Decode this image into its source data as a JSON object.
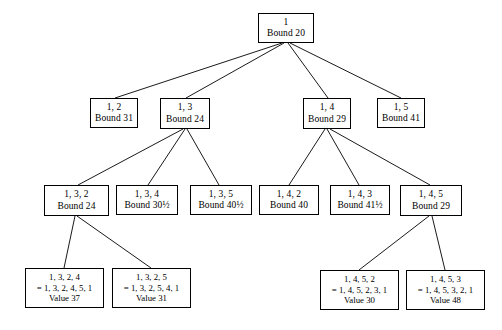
{
  "figure": {
    "name": "branch-and-bound-search-tree",
    "background_color": "#ffffff",
    "line_color": "#000000",
    "text_color": "#000000"
  },
  "nodes": [
    {
      "id": "root",
      "label_lines": [
        "1",
        "Bound 20"
      ],
      "path": "1",
      "bound": "20",
      "x": 258,
      "y": 13,
      "w": 56,
      "h": 30,
      "kind": "internal"
    },
    {
      "id": "n12",
      "label_lines": [
        "1, 2",
        "Bound 31"
      ],
      "path": "1, 2",
      "bound": "31",
      "x": 90,
      "y": 98,
      "w": 48,
      "h": 30,
      "kind": "internal"
    },
    {
      "id": "n13",
      "label_lines": [
        "1, 3",
        "Bound 24"
      ],
      "path": "1, 3",
      "bound": "24",
      "x": 160,
      "y": 98,
      "w": 50,
      "h": 31,
      "kind": "internal"
    },
    {
      "id": "n14",
      "label_lines": [
        "1, 4",
        "Bound 29"
      ],
      "path": "1, 4",
      "bound": "29",
      "x": 303,
      "y": 98,
      "w": 48,
      "h": 31,
      "kind": "internal"
    },
    {
      "id": "n15",
      "label_lines": [
        "1, 5",
        "Bound 41"
      ],
      "path": "1, 5",
      "bound": "41",
      "x": 377,
      "y": 98,
      "w": 48,
      "h": 30,
      "kind": "internal"
    },
    {
      "id": "n132",
      "label_lines": [
        "1, 3, 2",
        "Bound 24"
      ],
      "path": "1, 3, 2",
      "bound": "24",
      "x": 44,
      "y": 185,
      "w": 65,
      "h": 31,
      "kind": "internal"
    },
    {
      "id": "n134",
      "label_lines": [
        "1, 3, 4",
        "Bound 30½"
      ],
      "path": "1, 3, 4",
      "bound": "30½",
      "x": 116,
      "y": 185,
      "w": 62,
      "h": 30,
      "kind": "internal"
    },
    {
      "id": "n135",
      "label_lines": [
        "1, 3, 5",
        "Bound 40½"
      ],
      "path": "1, 3, 5",
      "bound": "40½",
      "x": 190,
      "y": 185,
      "w": 62,
      "h": 30,
      "kind": "internal"
    },
    {
      "id": "n142",
      "label_lines": [
        "1, 4, 2",
        "Bound 40"
      ],
      "path": "1, 4, 2",
      "bound": "40",
      "x": 259,
      "y": 185,
      "w": 60,
      "h": 30,
      "kind": "internal"
    },
    {
      "id": "n143",
      "label_lines": [
        "1, 4, 3",
        "Bound 41½"
      ],
      "path": "1, 4, 3",
      "bound": "41½",
      "x": 330,
      "y": 185,
      "w": 60,
      "h": 30,
      "kind": "internal"
    },
    {
      "id": "n145",
      "label_lines": [
        "1, 4, 5",
        "Bound 29"
      ],
      "path": "1, 4, 5",
      "bound": "29",
      "x": 400,
      "y": 185,
      "w": 62,
      "h": 31,
      "kind": "internal"
    },
    {
      "id": "n1324",
      "label_lines": [
        "1, 3, 2, 4",
        "= 1, 3, 2, 4, 5, 1",
        "Value 37"
      ],
      "path": "1, 3, 2, 4",
      "tour": "= 1, 3, 2, 4, 5, 1",
      "value": "Value 37",
      "x": 25,
      "y": 268,
      "w": 79,
      "h": 40,
      "kind": "leaf"
    },
    {
      "id": "n1325",
      "label_lines": [
        "1, 3, 2, 5",
        "= 1, 3, 2, 5, 4, 1",
        "Value 31"
      ],
      "path": "1, 3, 2, 5",
      "tour": "= 1, 3, 2, 5, 4, 1",
      "value": "Value 31",
      "x": 112,
      "y": 268,
      "w": 79,
      "h": 40,
      "kind": "leaf"
    },
    {
      "id": "n1452",
      "label_lines": [
        "1, 4, 5, 2",
        "= 1, 4, 5, 2, 3, 1",
        "Value 30"
      ],
      "path": "1, 4, 5, 2",
      "tour": "= 1, 4, 5, 2, 3, 1",
      "value": "Value 30",
      "x": 320,
      "y": 270,
      "w": 79,
      "h": 40,
      "kind": "leaf"
    },
    {
      "id": "n1453",
      "label_lines": [
        "1, 4, 5, 3",
        "= 1, 4, 5, 3, 2, 1",
        "Value 48"
      ],
      "path": "1, 4, 5, 3",
      "tour": "= 1, 4, 5, 3, 2, 1",
      "value": "Value 48",
      "x": 406,
      "y": 270,
      "w": 79,
      "h": 40,
      "kind": "leaf"
    }
  ],
  "edges": [
    {
      "from": "root",
      "to": "n12",
      "x1": 282,
      "y1": 43,
      "x2": 115,
      "y2": 98
    },
    {
      "from": "root",
      "to": "n13",
      "x1": 284,
      "y1": 43,
      "x2": 186,
      "y2": 98
    },
    {
      "from": "root",
      "to": "n14",
      "x1": 288,
      "y1": 43,
      "x2": 328,
      "y2": 98
    },
    {
      "from": "root",
      "to": "n15",
      "x1": 290,
      "y1": 43,
      "x2": 401,
      "y2": 98
    },
    {
      "from": "n13",
      "to": "n132",
      "x1": 183,
      "y1": 129,
      "x2": 78,
      "y2": 185
    },
    {
      "from": "n13",
      "to": "n134",
      "x1": 185,
      "y1": 129,
      "x2": 148,
      "y2": 185
    },
    {
      "from": "n13",
      "to": "n135",
      "x1": 187,
      "y1": 129,
      "x2": 219,
      "y2": 185
    },
    {
      "from": "n14",
      "to": "n142",
      "x1": 325,
      "y1": 129,
      "x2": 289,
      "y2": 185
    },
    {
      "from": "n14",
      "to": "n143",
      "x1": 327,
      "y1": 129,
      "x2": 359,
      "y2": 185
    },
    {
      "from": "n14",
      "to": "n145",
      "x1": 330,
      "y1": 129,
      "x2": 430,
      "y2": 185
    },
    {
      "from": "n132",
      "to": "n1324",
      "x1": 75,
      "y1": 216,
      "x2": 64,
      "y2": 268
    },
    {
      "from": "n132",
      "to": "n1325",
      "x1": 77,
      "y1": 216,
      "x2": 151,
      "y2": 268
    },
    {
      "from": "n145",
      "to": "n1452",
      "x1": 429,
      "y1": 216,
      "x2": 359,
      "y2": 270
    },
    {
      "from": "n145",
      "to": "n1453",
      "x1": 432,
      "y1": 216,
      "x2": 445,
      "y2": 270
    }
  ]
}
